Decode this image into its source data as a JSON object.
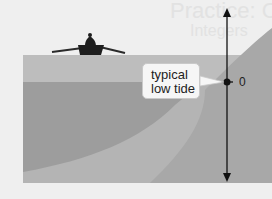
{
  "diagram": {
    "callout": {
      "line1": "typical",
      "line2": "low tide"
    },
    "axis_zero_label": "0",
    "ghost_text_line1": "Practice: Comparing",
    "ghost_text_line2": "Integers",
    "colors": {
      "background": "#efefef",
      "upper_water": "#bdbdbd",
      "deep_water": "#9d9d9d",
      "seafloor": "#b3b3b3",
      "shore": "#a6a6a6",
      "axis": "#111111",
      "boat": "#1e1e1e"
    }
  }
}
